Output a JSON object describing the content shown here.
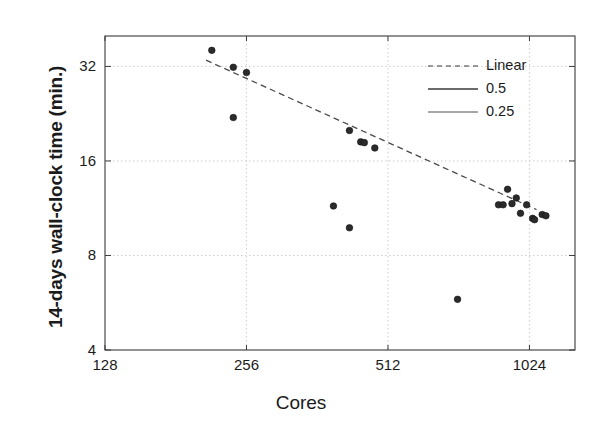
{
  "chart_data": {
    "type": "scatter",
    "title": "",
    "xlabel": "Cores",
    "ylabel": "14-days wall-clock time (min.)",
    "xscale": "log2",
    "yscale": "log2",
    "xlim": [
      128,
      1280
    ],
    "ylim": [
      4,
      40
    ],
    "xticks": [
      128,
      256,
      512,
      1024
    ],
    "xtick_labels": [
      "128",
      "256",
      "512",
      "1024"
    ],
    "yticks": [
      4,
      8,
      16,
      32
    ],
    "ytick_labels": [
      "4",
      "8",
      "16",
      "32"
    ],
    "grid": true,
    "legend_position": "top-right",
    "series": [
      {
        "name": "measurements",
        "marker": "circle",
        "color": "#2b2b2b",
        "points": [
          {
            "x": 216,
            "y": 36.0
          },
          {
            "x": 240,
            "y": 31.8
          },
          {
            "x": 256,
            "y": 30.6
          },
          {
            "x": 240,
            "y": 22.0
          },
          {
            "x": 424,
            "y": 20.0
          },
          {
            "x": 448,
            "y": 18.4
          },
          {
            "x": 456,
            "y": 18.3
          },
          {
            "x": 480,
            "y": 17.6
          },
          {
            "x": 392,
            "y": 11.5
          },
          {
            "x": 424,
            "y": 9.8
          },
          {
            "x": 720,
            "y": 5.8
          },
          {
            "x": 880,
            "y": 11.6
          },
          {
            "x": 900,
            "y": 11.6
          },
          {
            "x": 920,
            "y": 13.0
          },
          {
            "x": 940,
            "y": 11.7
          },
          {
            "x": 960,
            "y": 12.2
          },
          {
            "x": 980,
            "y": 10.9
          },
          {
            "x": 1010,
            "y": 11.6
          },
          {
            "x": 1040,
            "y": 10.5
          },
          {
            "x": 1050,
            "y": 10.4
          },
          {
            "x": 1090,
            "y": 10.8
          },
          {
            "x": 1110,
            "y": 10.7
          }
        ]
      }
    ],
    "fit_lines": [
      {
        "name": "Linear",
        "style": "dashed",
        "x0": 210,
        "y0": 33.5,
        "x1": 1060,
        "y1": 11.2
      }
    ],
    "legend": [
      {
        "label": "Linear",
        "style": "dashed",
        "width": 1.2
      },
      {
        "label": "0.5",
        "style": "solid",
        "width": 1.6
      },
      {
        "label": "0.25",
        "style": "solid",
        "width": 0.9
      }
    ]
  },
  "axis": {
    "y_title": "14-days wall-clock time (min.)",
    "x_title": "Cores"
  }
}
